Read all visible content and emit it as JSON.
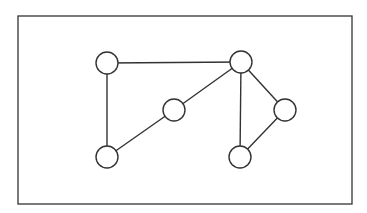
{
  "diagram": {
    "type": "undirected-graph",
    "background": "#ffffff",
    "stroke_color": "#333333",
    "frame": {
      "x": 18,
      "y": 16,
      "width": 334,
      "height": 188
    },
    "node_radius": 11,
    "nodes": [
      {
        "id": "n1",
        "x": 107,
        "y": 63
      },
      {
        "id": "n2",
        "x": 241,
        "y": 62
      },
      {
        "id": "n3",
        "x": 174,
        "y": 110
      },
      {
        "id": "n4",
        "x": 285,
        "y": 110
      },
      {
        "id": "n5",
        "x": 107,
        "y": 157
      },
      {
        "id": "n6",
        "x": 240,
        "y": 157
      }
    ],
    "edges": [
      {
        "from": "n1",
        "to": "n2"
      },
      {
        "from": "n1",
        "to": "n5"
      },
      {
        "from": "n5",
        "to": "n3"
      },
      {
        "from": "n3",
        "to": "n2"
      },
      {
        "from": "n2",
        "to": "n6"
      },
      {
        "from": "n2",
        "to": "n4"
      },
      {
        "from": "n4",
        "to": "n6"
      }
    ]
  }
}
